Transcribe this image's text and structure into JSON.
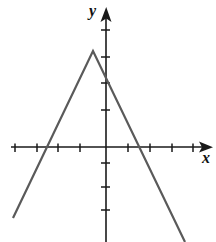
{
  "figure": {
    "background_color": "#ffffff",
    "axis_color": "#1a1a1a",
    "curve_color": "#5a5a5a",
    "width": 216,
    "height": 242
  },
  "axes": {
    "x_label": "x",
    "y_label": "y",
    "x_label_name": "x-axis-label",
    "y_label_name": "y-axis-label",
    "origin_px": {
      "x": 106,
      "y": 147
    },
    "unit_px": 21.7,
    "x_axis_pixel_y": 147,
    "y_axis_pixel_x": 106,
    "x_tick_pixels": [
      15,
      37,
      58,
      80,
      128,
      150,
      172,
      193
    ],
    "y_tick_pixels": [
      30,
      57,
      83,
      110,
      163,
      187,
      210
    ],
    "x_arrow_tip_px": 212,
    "y_arrow_tip_px": 8,
    "tick_half_length_px": 4,
    "tick_labels_shown": false
  },
  "chart_data": {
    "type": "line",
    "title": "",
    "subtitle": "",
    "xlabel": "x",
    "ylabel": "y",
    "grid": false,
    "legend": null,
    "xlim": [
      -4.2,
      4.9
    ],
    "ylim": [
      -4.4,
      6.4
    ],
    "x_tick_values": [
      -4,
      -3,
      -2,
      -1,
      1,
      2,
      3,
      4
    ],
    "y_tick_values": [
      5,
      4,
      3,
      2,
      -1,
      -2,
      -3
    ],
    "series": [
      {
        "name": "y = -2|x + 0.6| + 4.4",
        "style": "solid",
        "color": "#5a5a5a",
        "width_px": 2.2,
        "vertex": {
          "x": -0.6,
          "y": 4.4
        },
        "x_intercepts": [
          -2.76,
          1.52
        ],
        "y_intercept": 3.2,
        "left_branch_slope": 2.2,
        "right_branch_slope": -2.2,
        "points_px": [
          {
            "x": 13,
            "y": 218
          },
          {
            "x": 93,
            "y": 51
          },
          {
            "x": 185,
            "y": 242
          }
        ],
        "points_data": [
          {
            "x": -4.29,
            "y": -3.27
          },
          {
            "x": -0.6,
            "y": 4.42
          },
          {
            "x": 3.64,
            "y": -4.38
          }
        ]
      }
    ]
  }
}
